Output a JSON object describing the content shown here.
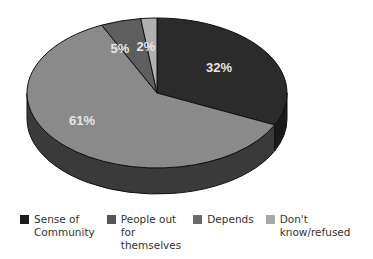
{
  "chart_data": {
    "type": "pie",
    "style": "3d",
    "title": "",
    "categories": [
      "Sense of Community",
      "People out for themselves",
      "Depends",
      "Don't know/refused"
    ],
    "values": [
      32,
      61,
      5,
      2
    ],
    "labels": [
      "32%",
      "61%",
      "5%",
      "2%"
    ],
    "colors": [
      "#2b2b2b",
      "#8a8a8a",
      "#5e5e5e",
      "#b0b0b0"
    ],
    "legend_position": "bottom"
  },
  "legend": [
    {
      "label": "Sense of\nCommunity",
      "color": "#1c1c1c"
    },
    {
      "label": "People out for\nthemselves",
      "color": "#555555"
    },
    {
      "label": "Depends",
      "color": "#6a6a6a"
    },
    {
      "label": "Don't know/refused",
      "color": "#a8a8a8"
    }
  ]
}
